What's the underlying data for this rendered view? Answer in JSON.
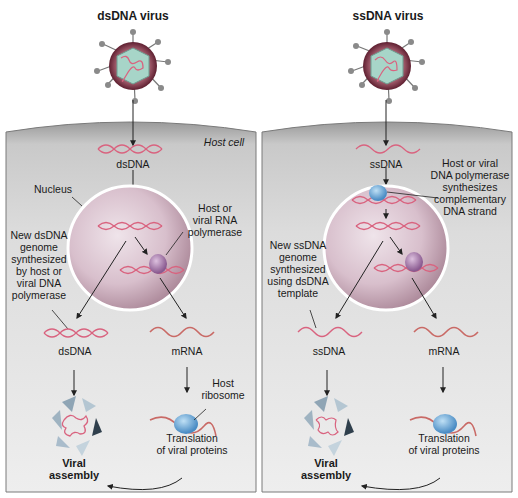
{
  "panels": [
    {
      "id": "dsdna",
      "title": "dsDNA virus",
      "host_cell_label": "Host cell",
      "entry_genome_label": "dsDNA",
      "nucleus_label": "Nucleus",
      "polymerase_label": "Host or\nviral RNA\npolymerase",
      "replication_label": "New dsDNA\ngenome\nsynthesized\nby host or\nviral DNA\npolymerase",
      "progeny_genome_label": "dsDNA",
      "mrna_label": "mRNA",
      "ribosome_label": "Host\nribosome",
      "translation_label": "Translation\nof viral proteins",
      "assembly_label": "Viral\nassembly"
    },
    {
      "id": "ssdna",
      "title": "ssDNA virus",
      "entry_genome_label": "ssDNA",
      "polymerase_label": "Host or viral\nDNA polymerase\nsynthesizes\ncomplementary\nDNA strand",
      "replication_label": "New ssDNA\ngenome\nsynthesized\nusing dsDNA\ntemplate",
      "progeny_genome_label": "ssDNA",
      "mrna_label": "mRNA",
      "translation_label": "Translation\nof viral proteins",
      "assembly_label": "Viral\nassembly"
    }
  ],
  "colors": {
    "cell_fill": "#d9d9d9",
    "cell_membrane": "#8a8a8a",
    "nucleus_fill": "#c9a9b8",
    "dna_strand": "#d9637f",
    "capsid": "#a7d5c8",
    "envelope": "#7a2a3d",
    "polymerase": "#a678a8",
    "ribosome": "#6aa8d8",
    "arrow": "#222222"
  }
}
